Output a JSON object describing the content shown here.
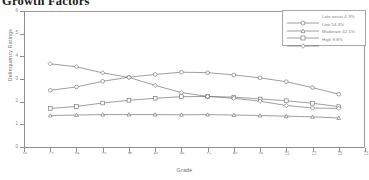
{
  "title": "Growth Factors",
  "chart_data": {
    "type": "line",
    "title": "Growth Factors",
    "xlabel": "Grade",
    "ylabel": "Delinquency Ratings",
    "xlim": [
      0,
      13
    ],
    "ylim": [
      0,
      6
    ],
    "xticks": [
      "0",
      "1",
      "2",
      "3",
      "4",
      "5",
      "6",
      "7",
      "8",
      "9",
      "10",
      "11",
      "12",
      "13"
    ],
    "yticks": [
      "0",
      "1",
      "2",
      "3",
      "4",
      "5",
      "6"
    ],
    "grid": false,
    "legend_position": "top-right",
    "x": [
      1,
      2,
      3,
      4,
      5,
      6,
      7,
      8,
      9,
      10,
      11,
      12
    ],
    "series": [
      {
        "name": "Late onset 4.3%",
        "marker": "circle",
        "values": [
          2.5,
          2.65,
          2.9,
          3.08,
          3.2,
          3.3,
          3.28,
          3.18,
          3.05,
          2.88,
          2.62,
          2.33
        ]
      },
      {
        "name": "Low 54.3%",
        "marker": "triangle",
        "values": [
          1.39,
          1.41,
          1.43,
          1.43,
          1.43,
          1.42,
          1.43,
          1.41,
          1.39,
          1.36,
          1.33,
          1.28
        ]
      },
      {
        "name": "Moderate 42.1%",
        "marker": "square",
        "values": [
          1.7,
          1.79,
          1.94,
          2.06,
          2.15,
          2.22,
          2.23,
          2.2,
          2.12,
          2.04,
          1.93,
          1.78
        ]
      },
      {
        "name": "High 9.8%",
        "marker": "diamond",
        "values": [
          3.67,
          3.54,
          3.27,
          3.07,
          2.72,
          2.4,
          2.23,
          2.15,
          2.02,
          1.83,
          1.72,
          1.7
        ]
      }
    ]
  },
  "legend": {
    "entries": [
      {
        "label": "Late onset 4.3%",
        "marker": "circle-icon"
      },
      {
        "label": "Low 54.3%",
        "marker": "triangle-icon"
      },
      {
        "label": "Moderate 42.1%",
        "marker": "square-icon"
      },
      {
        "label": "High 9.8%",
        "marker": "diamond-icon"
      }
    ]
  }
}
